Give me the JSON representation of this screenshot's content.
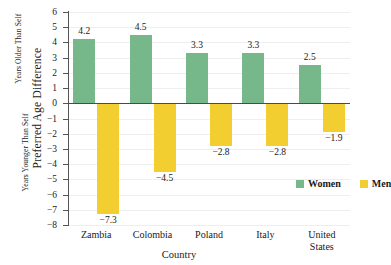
{
  "chart_data": {
    "type": "bar",
    "title": "",
    "xlabel": "Country",
    "ylabel": "Preferred Age Difference",
    "ylabel_upper": "Years Older Than Self",
    "ylabel_lower": "Years Younger Than Self",
    "categories": [
      "Zambia",
      "Colombia",
      "Poland",
      "Italy",
      "United States"
    ],
    "series": [
      {
        "name": "Women",
        "color": "#76b88a",
        "values": [
          4.2,
          4.5,
          3.3,
          3.3,
          2.5
        ]
      },
      {
        "name": "Men",
        "color": "#f2ce30",
        "values": [
          -7.3,
          -4.5,
          -2.8,
          -2.8,
          -1.9
        ]
      }
    ],
    "value_labels": {
      "Women": [
        "4.2",
        "4.5",
        "3.3",
        "3.3",
        "2.5"
      ],
      "Men": [
        "−7.3",
        "−4.5",
        "−2.8",
        "−2.8",
        "−1.9"
      ]
    },
    "ylim": [
      -8,
      6
    ],
    "ytick_values": [
      6,
      5,
      4,
      3,
      2,
      1,
      0,
      -1,
      -2,
      -3,
      -4,
      -5,
      -6,
      -7,
      -8
    ],
    "ytick_labels": [
      "6",
      "5",
      "4",
      "3",
      "2",
      "1",
      "0",
      "−1",
      "−2",
      "−3",
      "−4",
      "−5",
      "−6",
      "−7",
      "−8"
    ],
    "grid": true,
    "legend_position": "inside-lower-right",
    "legend": [
      "Women",
      "Men"
    ]
  }
}
